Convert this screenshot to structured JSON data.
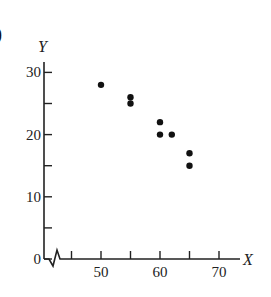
{
  "panel_label": ")",
  "chart_data": {
    "type": "scatter",
    "title": "",
    "xlabel": "X",
    "ylabel": "Y",
    "xlim": [
      40,
      75
    ],
    "ylim": [
      0,
      32
    ],
    "x_axis_break": true,
    "grid": false,
    "legend": null,
    "x_ticks": [
      45,
      50,
      55,
      60,
      65,
      70
    ],
    "x_tick_labels": [
      "",
      "50",
      "",
      "60",
      "",
      "70"
    ],
    "y_ticks": [
      0,
      5,
      10,
      15,
      20,
      25,
      30
    ],
    "y_tick_labels": [
      "0",
      "",
      "10",
      "",
      "20",
      "",
      "30"
    ],
    "x": [
      50,
      55,
      55,
      60,
      60,
      62,
      65,
      65
    ],
    "y": [
      28,
      26,
      25,
      22,
      20,
      20,
      17,
      15
    ]
  }
}
